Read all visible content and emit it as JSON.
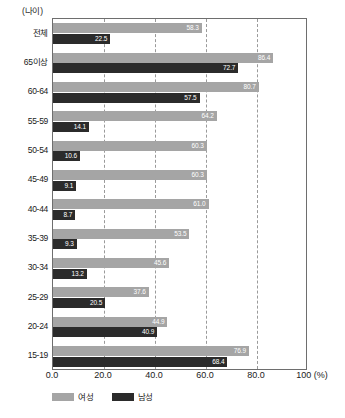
{
  "axis_caption": "(나이)",
  "legend": {
    "position": "bottom-left",
    "items": [
      {
        "label": "여성",
        "color": "#a5a5a5",
        "swatch_name": "legend-swatch-female"
      },
      {
        "label": "남성",
        "color": "#2b2b2b",
        "swatch_name": "legend-swatch-male"
      }
    ]
  },
  "x_axis": {
    "ticks": [
      "0.0",
      "20.0",
      "40.0",
      "60.0",
      "80.0",
      "100 (%)"
    ],
    "tick_values": [
      0,
      20,
      40,
      60,
      80,
      100
    ],
    "unit": "(%)"
  },
  "chart_data": {
    "type": "bar",
    "orientation": "horizontal",
    "title": "",
    "subtitle": "",
    "xlabel": "(%)",
    "ylabel": "(나이)",
    "xlim": [
      0,
      100
    ],
    "grid": true,
    "grid_axis": "x",
    "legend_position": "bottom-left",
    "categories": [
      "전체",
      "65이상",
      "60-64",
      "55-59",
      "50-54",
      "45-49",
      "40-44",
      "35-39",
      "30-34",
      "25-29",
      "20-24",
      "15-19"
    ],
    "series": [
      {
        "name": "여성",
        "color": "#a5a5a5",
        "values": [
          58.3,
          86.4,
          80.7,
          64.2,
          60.3,
          60.3,
          61.0,
          53.5,
          45.6,
          37.6,
          44.9,
          76.9
        ]
      },
      {
        "name": "남성",
        "color": "#2b2b2b",
        "values": [
          22.5,
          72.7,
          57.5,
          14.1,
          10.6,
          9.1,
          8.7,
          9.3,
          13.2,
          20.5,
          40.9,
          68.4
        ]
      }
    ]
  }
}
